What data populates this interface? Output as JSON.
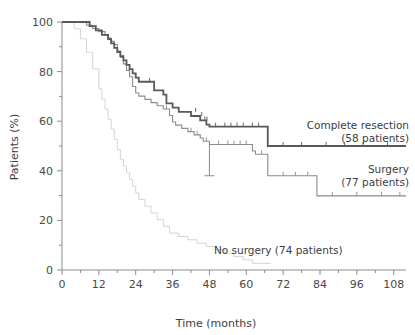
{
  "chart_data": {
    "type": "line",
    "title": "",
    "subtitle": "",
    "xlabel": "Time (months)",
    "ylabel": "Patients (%)",
    "xlim": [
      0,
      112
    ],
    "ylim": [
      0,
      100
    ],
    "grid": false,
    "legend_position": "inline-right",
    "x_ticks": [
      0,
      12,
      24,
      36,
      48,
      60,
      72,
      84,
      96,
      108
    ],
    "x_tick_labels": [
      "0",
      "12",
      "24",
      "36",
      "48",
      "60",
      "72",
      "84",
      "96",
      "108"
    ],
    "x_minor_ticks": [
      6,
      18,
      30,
      42,
      54,
      66,
      78,
      90,
      102
    ],
    "y_ticks": [
      0,
      20,
      40,
      60,
      80,
      100
    ],
    "y_tick_labels": [
      "0",
      "20",
      "40",
      "60",
      "80",
      "100"
    ],
    "y_minor_ticks": [
      10,
      30,
      50,
      70,
      90
    ],
    "series": [
      {
        "name": "Complete resection",
        "label_line1": "Complete resection",
        "label_line2": "(58 patients)",
        "n_patients": 58,
        "color": "#58595b",
        "width": 1.8,
        "steps": [
          [
            0,
            100
          ],
          [
            9,
            100
          ],
          [
            9,
            98.3
          ],
          [
            11,
            98.3
          ],
          [
            11,
            96.6
          ],
          [
            13,
            96.6
          ],
          [
            13,
            94.8
          ],
          [
            15,
            94.8
          ],
          [
            15,
            93.1
          ],
          [
            16,
            93.1
          ],
          [
            16,
            91.4
          ],
          [
            17,
            91.4
          ],
          [
            17,
            89.6
          ],
          [
            18,
            89.6
          ],
          [
            18,
            87.9
          ],
          [
            19,
            87.9
          ],
          [
            19,
            86.2
          ],
          [
            20,
            86.2
          ],
          [
            20,
            84.5
          ],
          [
            21,
            84.5
          ],
          [
            21,
            82.7
          ],
          [
            22,
            82.7
          ],
          [
            22,
            81.0
          ],
          [
            23,
            81.0
          ],
          [
            23,
            79.3
          ],
          [
            24,
            79.3
          ],
          [
            24,
            77.6
          ],
          [
            25,
            77.6
          ],
          [
            25,
            75.9
          ],
          [
            28,
            75.9
          ],
          [
            28,
            75.9
          ],
          [
            30,
            75.9
          ],
          [
            30,
            72.4
          ],
          [
            33,
            72.4
          ],
          [
            33,
            70.7
          ],
          [
            34,
            70.7
          ],
          [
            34,
            67.2
          ],
          [
            36,
            67.2
          ],
          [
            36,
            65.5
          ],
          [
            38,
            65.5
          ],
          [
            38,
            63.8
          ],
          [
            42,
            63.8
          ],
          [
            42,
            62.1
          ],
          [
            45,
            62.1
          ],
          [
            45,
            60.3
          ],
          [
            47,
            60.3
          ],
          [
            47,
            58.6
          ],
          [
            48,
            58.6
          ],
          [
            48,
            57.8
          ],
          [
            67,
            57.8
          ],
          [
            67,
            50.0
          ],
          [
            112,
            50.0
          ]
        ],
        "censor_marks": [
          [
            28.5,
            75.9
          ],
          [
            43.5,
            63.8
          ],
          [
            45.5,
            62.1
          ],
          [
            46.5,
            60.3
          ],
          [
            47.2,
            60.3
          ],
          [
            50,
            57.8
          ],
          [
            53,
            57.8
          ],
          [
            55,
            57.8
          ],
          [
            57,
            57.8
          ],
          [
            59,
            57.8
          ],
          [
            62,
            57.8
          ],
          [
            64,
            57.8
          ],
          [
            72,
            50.0
          ],
          [
            78,
            50.0
          ],
          [
            86,
            50.0
          ],
          [
            92,
            50.0
          ],
          [
            98,
            50.0
          ],
          [
            106,
            50.0
          ]
        ]
      },
      {
        "name": "Surgery",
        "label_line1": "Surgery",
        "label_line2": "(77 patients)",
        "n_patients": 77,
        "color": "#8b8b8b",
        "width": 1.1,
        "steps": [
          [
            0,
            100
          ],
          [
            8,
            100
          ],
          [
            8,
            98.7
          ],
          [
            10,
            98.7
          ],
          [
            10,
            97.4
          ],
          [
            12,
            97.4
          ],
          [
            12,
            96.1
          ],
          [
            14,
            96.1
          ],
          [
            14,
            94.8
          ],
          [
            15,
            94.8
          ],
          [
            15,
            93.5
          ],
          [
            16,
            93.5
          ],
          [
            16,
            92.2
          ],
          [
            17,
            92.2
          ],
          [
            17,
            90.9
          ],
          [
            18,
            90.9
          ],
          [
            18,
            88.3
          ],
          [
            19,
            88.3
          ],
          [
            19,
            85.7
          ],
          [
            20,
            85.7
          ],
          [
            20,
            83.1
          ],
          [
            21,
            83.1
          ],
          [
            21,
            80.5
          ],
          [
            22,
            80.5
          ],
          [
            22,
            77.9
          ],
          [
            23,
            77.9
          ],
          [
            23,
            74.0
          ],
          [
            24,
            74.0
          ],
          [
            24,
            71.4
          ],
          [
            25,
            71.4
          ],
          [
            25,
            70.1
          ],
          [
            27,
            70.1
          ],
          [
            27,
            68.8
          ],
          [
            29,
            68.8
          ],
          [
            29,
            67.5
          ],
          [
            31,
            67.5
          ],
          [
            31,
            66.2
          ],
          [
            33,
            66.2
          ],
          [
            33,
            64.9
          ],
          [
            35,
            64.9
          ],
          [
            35,
            62.3
          ],
          [
            36,
            62.3
          ],
          [
            36,
            59.7
          ],
          [
            37,
            59.7
          ],
          [
            37,
            58.4
          ],
          [
            39,
            58.4
          ],
          [
            39,
            57.1
          ],
          [
            41,
            57.1
          ],
          [
            41,
            55.8
          ],
          [
            43,
            55.8
          ],
          [
            43,
            54.5
          ],
          [
            45,
            54.5
          ],
          [
            45,
            53.2
          ],
          [
            46,
            53.2
          ],
          [
            46,
            51.9
          ],
          [
            48,
            51.9
          ],
          [
            48,
            50.6
          ],
          [
            62,
            50.6
          ],
          [
            62,
            48.0
          ],
          [
            63,
            48.0
          ],
          [
            63,
            46.7
          ],
          [
            67,
            46.7
          ],
          [
            67,
            38.0
          ],
          [
            83,
            38.0
          ],
          [
            83,
            29.9
          ],
          [
            112,
            29.9
          ]
        ],
        "censor_marks": [
          [
            34,
            64.9
          ],
          [
            42,
            55.8
          ],
          [
            44,
            54.5
          ],
          [
            47,
            51.9
          ],
          [
            51,
            50.6
          ],
          [
            54,
            50.6
          ],
          [
            56,
            50.6
          ],
          [
            58,
            50.6
          ],
          [
            60,
            50.6
          ],
          [
            65,
            46.7
          ],
          [
            72,
            38.0
          ],
          [
            76,
            38.0
          ],
          [
            80,
            38.0
          ],
          [
            88,
            29.9
          ],
          [
            96,
            29.9
          ],
          [
            104,
            29.9
          ],
          [
            110,
            29.9
          ]
        ]
      },
      {
        "name": "No surgery",
        "label_line1": "No surgery (74 patients)",
        "label_line2": "",
        "n_patients": 74,
        "color": "#d4d4d4",
        "width": 1.0,
        "steps": [
          [
            0,
            100
          ],
          [
            4,
            100
          ],
          [
            4,
            97.3
          ],
          [
            6,
            97.3
          ],
          [
            6,
            93.2
          ],
          [
            8,
            93.2
          ],
          [
            8,
            87.8
          ],
          [
            10,
            87.8
          ],
          [
            10,
            81.1
          ],
          [
            12,
            81.1
          ],
          [
            12,
            73.0
          ],
          [
            13,
            73.0
          ],
          [
            13,
            68.9
          ],
          [
            14,
            68.9
          ],
          [
            14,
            64.9
          ],
          [
            15,
            64.9
          ],
          [
            15,
            60.8
          ],
          [
            16,
            60.8
          ],
          [
            16,
            56.8
          ],
          [
            17,
            56.8
          ],
          [
            17,
            52.7
          ],
          [
            18,
            52.7
          ],
          [
            18,
            48.6
          ],
          [
            19,
            48.6
          ],
          [
            19,
            44.6
          ],
          [
            20,
            44.6
          ],
          [
            20,
            41.9
          ],
          [
            21,
            41.9
          ],
          [
            21,
            39.2
          ],
          [
            22,
            39.2
          ],
          [
            22,
            36.5
          ],
          [
            23,
            36.5
          ],
          [
            23,
            33.8
          ],
          [
            24,
            33.8
          ],
          [
            24,
            31.1
          ],
          [
            25,
            31.1
          ],
          [
            25,
            28.4
          ],
          [
            27,
            28.4
          ],
          [
            27,
            25.7
          ],
          [
            29,
            25.7
          ],
          [
            29,
            23.0
          ],
          [
            31,
            23.0
          ],
          [
            31,
            20.3
          ],
          [
            33,
            20.3
          ],
          [
            33,
            17.6
          ],
          [
            35,
            17.6
          ],
          [
            35,
            14.9
          ],
          [
            38,
            14.9
          ],
          [
            38,
            13.5
          ],
          [
            41,
            13.5
          ],
          [
            41,
            12.2
          ],
          [
            44,
            12.2
          ],
          [
            44,
            10.8
          ],
          [
            47,
            10.8
          ],
          [
            47,
            9.5
          ],
          [
            50,
            9.5
          ],
          [
            50,
            8.1
          ],
          [
            53,
            8.1
          ],
          [
            53,
            6.8
          ],
          [
            56,
            6.8
          ],
          [
            56,
            5.4
          ],
          [
            59,
            5.4
          ],
          [
            59,
            4.1
          ],
          [
            62,
            4.1
          ],
          [
            62,
            2.7
          ],
          [
            68,
            2.7
          ]
        ],
        "censor_marks": []
      }
    ],
    "error_bars": [
      {
        "x": 48,
        "y": 50.6,
        "low": 38.0,
        "high": 50.6,
        "color": "#8b8b8b",
        "cap": 5
      }
    ],
    "annotations": [
      {
        "id": "complete-resection-label",
        "text_line1": "Complete resection",
        "text_line2": "(58 patients)",
        "x_px": 409,
        "y_px": 129,
        "anchor": "end"
      },
      {
        "id": "surgery-label",
        "text_line1": "Surgery",
        "text_line2": "(77 patients)",
        "x_px": 409,
        "y_px": 173,
        "anchor": "end"
      },
      {
        "id": "no-surgery-label",
        "text_line1": "No surgery (74 patients)",
        "text_line2": "",
        "x_px": 214,
        "y_px": 254,
        "anchor": "start"
      }
    ],
    "colors": {
      "axis": "#8c8c8c",
      "text": "#3d3d3d",
      "background": "#ffffff",
      "complete_resection": "#58595b",
      "surgery": "#8b8b8b",
      "no_surgery": "#d4d4d4"
    }
  }
}
